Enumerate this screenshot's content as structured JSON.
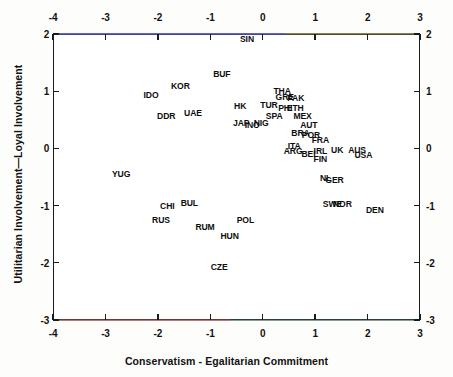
{
  "chart_data": {
    "type": "scatter",
    "title": "",
    "xlabel": "Conservatism - Egalitarian Commitment",
    "ylabel": "Utilitarian Involvement—Loyal Involvement",
    "xlim": [
      -4,
      3
    ],
    "ylim": [
      -3,
      2
    ],
    "xticks": [
      -4,
      -3,
      -2,
      -1,
      0,
      1,
      2,
      3
    ],
    "xticklabels": [
      "-4",
      "-3",
      "-2",
      "-1",
      "0",
      "1",
      "2",
      "3"
    ],
    "yticks": [
      -3,
      -2,
      -1,
      0,
      1,
      2
    ],
    "yticklabels": [
      "-3",
      "-2",
      "-1",
      "0",
      "1",
      "2"
    ],
    "grid": false,
    "legend": null,
    "axes_mirrored": true,
    "point_marker": "text-label-only",
    "points": [
      {
        "label": "SIN",
        "x": -0.3,
        "y": 1.92
      },
      {
        "label": "BUF",
        "x": -0.78,
        "y": 1.3
      },
      {
        "label": "KOR",
        "x": -1.57,
        "y": 1.09
      },
      {
        "label": "IDO",
        "x": -2.13,
        "y": 0.93
      },
      {
        "label": "THA",
        "x": 0.37,
        "y": 1.0
      },
      {
        "label": "GRE",
        "x": 0.42,
        "y": 0.9
      },
      {
        "label": "PAK",
        "x": 0.63,
        "y": 0.88
      },
      {
        "label": "TUR",
        "x": 0.12,
        "y": 0.76
      },
      {
        "label": "PHI",
        "x": 0.43,
        "y": 0.7
      },
      {
        "label": "ETH",
        "x": 0.62,
        "y": 0.7
      },
      {
        "label": "HK",
        "x": -0.43,
        "y": 0.74
      },
      {
        "label": "UAE",
        "x": -1.33,
        "y": 0.62
      },
      {
        "label": "DDR",
        "x": -1.84,
        "y": 0.57
      },
      {
        "label": "SPA",
        "x": 0.22,
        "y": 0.57
      },
      {
        "label": "MEX",
        "x": 0.76,
        "y": 0.56
      },
      {
        "label": "JAP",
        "x": -0.41,
        "y": 0.44
      },
      {
        "label": "INO",
        "x": -0.2,
        "y": 0.41
      },
      {
        "label": "NIG",
        "x": -0.03,
        "y": 0.45
      },
      {
        "label": "AUT",
        "x": 0.88,
        "y": 0.41
      },
      {
        "label": "BRA",
        "x": 0.72,
        "y": 0.27
      },
      {
        "label": "POR",
        "x": 0.92,
        "y": 0.24
      },
      {
        "label": "FRA",
        "x": 1.1,
        "y": 0.15
      },
      {
        "label": "ITA",
        "x": 0.6,
        "y": 0.05
      },
      {
        "label": "ARG",
        "x": 0.58,
        "y": -0.05
      },
      {
        "label": "BEL",
        "x": 0.9,
        "y": -0.1
      },
      {
        "label": "IRL",
        "x": 1.1,
        "y": -0.04
      },
      {
        "label": "UK",
        "x": 1.42,
        "y": -0.03
      },
      {
        "label": "AUS",
        "x": 1.8,
        "y": -0.02
      },
      {
        "label": "USA",
        "x": 1.92,
        "y": -0.11
      },
      {
        "label": "FIN",
        "x": 1.1,
        "y": -0.19
      },
      {
        "label": "YUG",
        "x": -2.7,
        "y": -0.45
      },
      {
        "label": "NL",
        "x": 1.2,
        "y": -0.52
      },
      {
        "label": "GER",
        "x": 1.37,
        "y": -0.55
      },
      {
        "label": "CHI",
        "x": -1.82,
        "y": -1.01
      },
      {
        "label": "BUL",
        "x": -1.4,
        "y": -0.95
      },
      {
        "label": "SWE",
        "x": 1.33,
        "y": -0.97
      },
      {
        "label": "NOR",
        "x": 1.52,
        "y": -0.98
      },
      {
        "label": "DEN",
        "x": 2.14,
        "y": -1.08
      },
      {
        "label": "RUS",
        "x": -1.94,
        "y": -1.26
      },
      {
        "label": "POL",
        "x": -0.33,
        "y": -1.25
      },
      {
        "label": "RUM",
        "x": -1.1,
        "y": -1.38
      },
      {
        "label": "HUN",
        "x": -0.63,
        "y": -1.54
      },
      {
        "label": "CZE",
        "x": -0.83,
        "y": -2.08
      }
    ]
  },
  "axes": {
    "x_title": "Conservatism - Egalitarian Commitment",
    "y_title": "Utilitarian Involvement—Loyal Involvement",
    "x_tick_labels": [
      "-4",
      "-3",
      "-2",
      "-1",
      "0",
      "1",
      "2",
      "3"
    ],
    "y_tick_labels": [
      "2",
      "1",
      "0",
      "-1",
      "-2",
      "-3"
    ]
  },
  "colors": {
    "axis": "#1b1b1b",
    "text": "#0d0d0d",
    "background": "#ffffff"
  }
}
